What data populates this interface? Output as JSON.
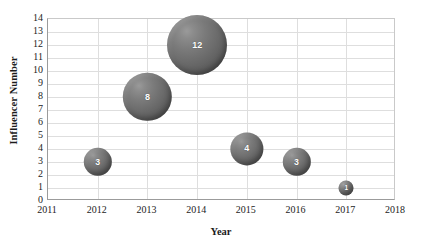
{
  "chart_data": {
    "type": "scatter",
    "subtype": "bubble",
    "title": "",
    "xlabel": "Year",
    "ylabel": "Influencer Number",
    "xlim": [
      2011,
      2018
    ],
    "ylim": [
      0,
      14
    ],
    "x_ticks": [
      "2011",
      "2012",
      "2013",
      "2014",
      "2015",
      "2016",
      "2017",
      "2018"
    ],
    "y_ticks": [
      "0",
      "1",
      "2",
      "3",
      "4",
      "5",
      "6",
      "7",
      "8",
      "9",
      "10",
      "11",
      "12",
      "13",
      "14"
    ],
    "grid": true,
    "legend": "none",
    "series": [
      {
        "name": "Influencer Number",
        "color": "#6e6e6e",
        "points": [
          {
            "x": 2012,
            "y": 3,
            "size": 3,
            "label": "3"
          },
          {
            "x": 2013,
            "y": 8,
            "size": 8,
            "label": "8"
          },
          {
            "x": 2014,
            "y": 12,
            "size": 12,
            "label": "12"
          },
          {
            "x": 2015,
            "y": 4,
            "size": 4,
            "label": "4"
          },
          {
            "x": 2016,
            "y": 3,
            "size": 3,
            "label": "3"
          },
          {
            "x": 2017,
            "y": 1,
            "size": 1,
            "label": "1"
          }
        ]
      }
    ]
  },
  "colors": {
    "bubble_fill": "#6e6e6e",
    "bubble_label": "#ffffff",
    "gridline": "#dedede",
    "axis_line": "#9b9b9b",
    "text": "#232323",
    "background": "#ffffff"
  }
}
